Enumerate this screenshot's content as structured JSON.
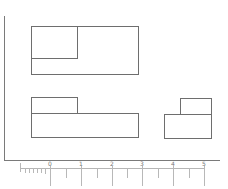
{
  "diagram": {
    "type": "block-diagram",
    "colors": {
      "line": "#6e6e6e",
      "axis": "#7a7a7a",
      "scale": "#b5b5b5",
      "background": "#ffffff"
    },
    "blocks": [
      {
        "id": "top-outer",
        "x": 31,
        "y": 26,
        "w": 108,
        "h": 49
      },
      {
        "id": "top-inner",
        "x": 31,
        "y": 26,
        "w": 47,
        "h": 33
      },
      {
        "id": "mid-left-small",
        "x": 31,
        "y": 97,
        "w": 47,
        "h": 17
      },
      {
        "id": "mid-left-large",
        "x": 31,
        "y": 113,
        "w": 108,
        "h": 25
      },
      {
        "id": "right-small",
        "x": 180,
        "y": 98,
        "w": 32,
        "h": 17
      },
      {
        "id": "right-large",
        "x": 164,
        "y": 114,
        "w": 48,
        "h": 25
      }
    ],
    "scale": {
      "labels": [
        "0",
        "1",
        "2",
        "3",
        "4",
        "5"
      ],
      "label_x": [
        50,
        81,
        112,
        142,
        173,
        204
      ]
    }
  }
}
